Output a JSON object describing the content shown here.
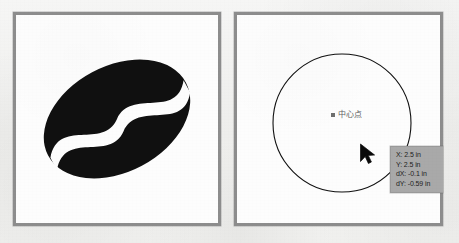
{
  "app": {
    "view_name": "two-panel-drawing-view",
    "background_color": "#f1f1ef"
  },
  "panels": [
    {
      "id": "left",
      "name": "coffee-bean-artboard",
      "border_color": "#8d8d8d",
      "fill_color": "#fdfdfd",
      "artwork": {
        "type": "coffee-bean-logo",
        "shape_color": "#101010",
        "split_color": "#fdfdfd",
        "rotation_deg": -28
      }
    },
    {
      "id": "right",
      "name": "circle-artboard",
      "border_color": "#8d8d8d",
      "fill_color": "#fdfdfd",
      "artwork": {
        "type": "circle-outline",
        "stroke_color": "#111111",
        "stroke_width": 1,
        "center_x": 105,
        "center_y": 108,
        "radius": 69
      }
    }
  ],
  "snap": {
    "marker_name": "center-snap-marker",
    "marker_color": "#6f6f6f",
    "label": "中心点"
  },
  "cursor": {
    "name": "arrow-cursor",
    "color": "#0a0a0a"
  },
  "tooltip": {
    "name": "dynamic-input-tooltip",
    "background_color": "#a9a9a9",
    "text_color": "#1d1d1d",
    "rows": [
      {
        "label": "X:",
        "value": "2.5",
        "unit": "in"
      },
      {
        "label": "Y:",
        "value": "2.5",
        "unit": "in"
      },
      {
        "label": "dX:",
        "value": "-0.1",
        "unit": "in"
      },
      {
        "label": "dY:",
        "value": "-0.59",
        "unit": "in"
      }
    ],
    "lines": [
      "X: 2.5 in",
      "Y: 2.5 in",
      "dX: -0.1 in",
      "dY: -0.59 in"
    ]
  }
}
